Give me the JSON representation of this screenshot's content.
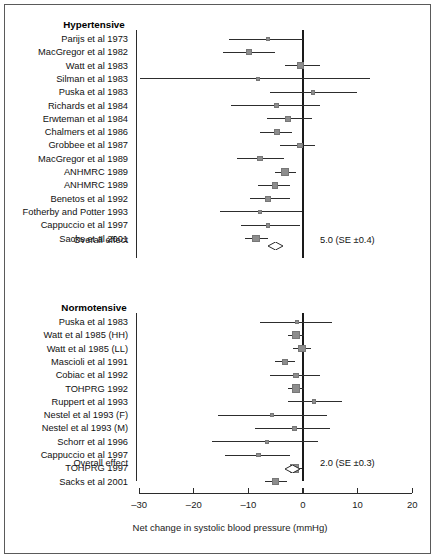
{
  "figure": {
    "axis_title": "Net change in systolic blood pressure (mmHg)",
    "tick_labels": [
      "–30",
      "–20",
      "–10",
      "0",
      "10",
      "20"
    ],
    "tick_values": [
      -30,
      -20,
      -10,
      0,
      10,
      20
    ],
    "marker_color": "#8d8d8d",
    "line_color": "#2d2d2d",
    "groups": [
      {
        "header": "Hypertensive",
        "overall_label": "Overall effect",
        "overall_value": "5.0 (SE ±0.4)"
      },
      {
        "header": "Normotensive",
        "overall_label": "Overall effect",
        "overall_value": "2.0 (SE ±0.3)"
      }
    ]
  },
  "chart_data": {
    "type": "forest",
    "title": "",
    "xlabel": "Net change in systolic blood pressure (mmHg)",
    "ylabel": "",
    "xlim": [
      -30,
      20
    ],
    "xticks": [
      -30,
      -20,
      -10,
      0,
      10,
      20
    ],
    "grid": false,
    "null_line": 0,
    "groups": [
      {
        "name": "Hypertensive",
        "studies": [
          {
            "label": "Parijs et al 1973",
            "effect": -6.4,
            "ci_low": -13.5,
            "ci_high": 0.0,
            "weight": 0.3
          },
          {
            "label": "MacGregor et al 1982",
            "effect": -9.9,
            "ci_low": -14.6,
            "ci_high": -5.1,
            "weight": 0.55
          },
          {
            "label": "Watt et al 1983",
            "effect": -0.4,
            "ci_low": -3.3,
            "ci_high": 3.1,
            "weight": 0.7
          },
          {
            "label": "Silman et al 1983",
            "effect": -8.2,
            "ci_low": -29.8,
            "ci_high": 12.3,
            "weight": 0.18
          },
          {
            "label": "Puska et al 1983",
            "effect": 1.8,
            "ci_low": -6.0,
            "ci_high": 9.9,
            "weight": 0.28
          },
          {
            "label": "Richards et al 1984",
            "effect": -4.9,
            "ci_low": -13.2,
            "ci_high": 3.1,
            "weight": 0.32
          },
          {
            "label": "Erwteman et al 1984",
            "effect": -2.7,
            "ci_low": -6.6,
            "ci_high": 1.6,
            "weight": 0.45
          },
          {
            "label": "Chalmers et al 1986",
            "effect": -4.8,
            "ci_low": -7.9,
            "ci_high": -2.0,
            "weight": 0.52
          },
          {
            "label": "Grobbee et al 1987",
            "effect": -0.6,
            "ci_low": -4.2,
            "ci_high": 2.2,
            "weight": 0.48
          },
          {
            "label": "MacGregor et al 1989",
            "effect": -7.9,
            "ci_low": -12.1,
            "ci_high": -3.5,
            "weight": 0.45
          },
          {
            "label": "ANHMRC 1989",
            "effect": -3.3,
            "ci_low": -5.1,
            "ci_high": -1.3,
            "weight": 0.95
          },
          {
            "label": "ANHMRC 1989",
            "effect": -5.1,
            "ci_low": -8.2,
            "ci_high": -2.4,
            "weight": 0.62
          },
          {
            "label": "Benetos et al 1992",
            "effect": -6.4,
            "ci_low": -9.7,
            "ci_high": -2.4,
            "weight": 0.55
          },
          {
            "label": "Fotherby and Potter 1993",
            "effect": -7.9,
            "ci_low": -15.2,
            "ci_high": -0.2,
            "weight": 0.25
          },
          {
            "label": "Cappuccio et al 1997",
            "effect": -6.4,
            "ci_low": -11.4,
            "ci_high": -0.5,
            "weight": 0.32
          },
          {
            "label": "Sacks et al 2001",
            "effect": -8.6,
            "ci_low": -10.6,
            "ci_high": -6.4,
            "weight": 0.85
          }
        ],
        "overall": {
          "label": "Overall effect",
          "effect": -5.0,
          "se": 0.4,
          "text": "5.0 (SE ±0.4)"
        }
      },
      {
        "name": "Normotensive",
        "studies": [
          {
            "label": "Puska et al 1983",
            "effect": -1.1,
            "ci_low": -7.9,
            "ci_high": 5.3,
            "weight": 0.25
          },
          {
            "label": "Watt et al 1985 (HH)",
            "effect": -1.3,
            "ci_low": -2.7,
            "ci_high": 0.2,
            "weight": 1.0
          },
          {
            "label": "Watt et al 1985 (LL)",
            "effect": -0.2,
            "ci_low": -1.8,
            "ci_high": 1.5,
            "weight": 0.78
          },
          {
            "label": "Mascioli et al 1991",
            "effect": -3.3,
            "ci_low": -5.1,
            "ci_high": -1.5,
            "weight": 0.68
          },
          {
            "label": "Cobiac et al 1992",
            "effect": -1.3,
            "ci_low": -6.0,
            "ci_high": 3.1,
            "weight": 0.4
          },
          {
            "label": "TOHPRG 1992",
            "effect": -1.3,
            "ci_low": -2.7,
            "ci_high": 0.2,
            "weight": 1.0
          },
          {
            "label": "Ruppert et al 1993",
            "effect": 2.0,
            "ci_low": -2.7,
            "ci_high": 7.1,
            "weight": 0.3
          },
          {
            "label": "Nestel et al 1993 (F)",
            "effect": -5.7,
            "ci_low": -15.6,
            "ci_high": 4.4,
            "weight": 0.22
          },
          {
            "label": "Nestel et al 1993 (M)",
            "effect": -1.6,
            "ci_low": -8.8,
            "ci_high": 4.9,
            "weight": 0.28
          },
          {
            "label": "Schorr et al 1996",
            "effect": -6.6,
            "ci_low": -16.7,
            "ci_high": 2.7,
            "weight": 0.22
          },
          {
            "label": "Cappuccio et al 1997",
            "effect": -8.2,
            "ci_low": -14.3,
            "ci_high": -2.4,
            "weight": 0.3
          },
          {
            "label": "TOHPRG 1997",
            "effect": -1.5,
            "ci_low": -2.4,
            "ci_high": -0.2,
            "weight": 1.05
          },
          {
            "label": "Sacks et al 2001",
            "effect": -5.1,
            "ci_low": -7.0,
            "ci_high": -2.9,
            "weight": 0.75
          }
        ],
        "overall": {
          "label": "Overall effect",
          "effect": -2.0,
          "se": 0.3,
          "text": "2.0 (SE ±0.3)"
        }
      }
    ]
  }
}
